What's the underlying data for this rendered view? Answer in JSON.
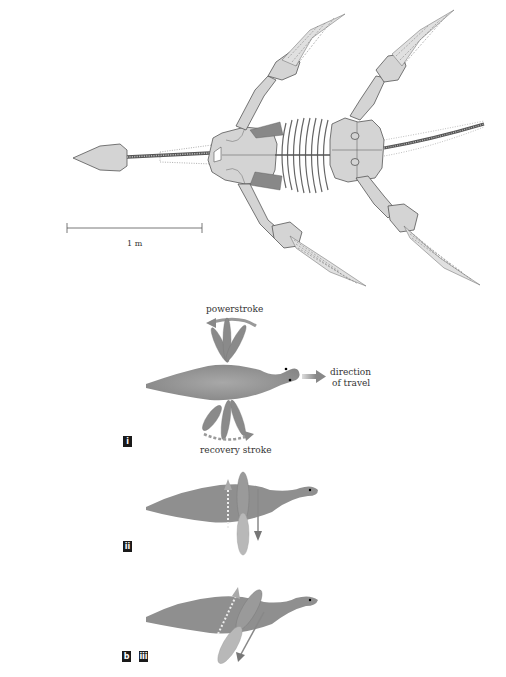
{
  "figure": {
    "skeleton": {
      "scale_bar_label": "1 m"
    },
    "panel_i": {
      "tag": "i",
      "powerstroke_label": "powerstroke",
      "recovery_label": "recovery stroke",
      "direction_label_line1": "direction",
      "direction_label_line2": "of travel"
    },
    "panel_ii": {
      "tag": "ii"
    },
    "panel_iii": {
      "part_tag": "b",
      "tag": "iii"
    },
    "colors": {
      "bone": "#d4d4d4",
      "body": "#8f8f8f",
      "tag_bg": "#1a1a1a"
    }
  }
}
